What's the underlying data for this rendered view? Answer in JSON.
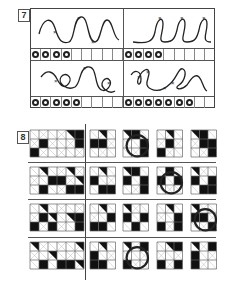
{
  "section7": {
    "number": "7",
    "tasks": [
      {
        "id": "top-left",
        "rings_filled": 4,
        "cells_total": 9
      },
      {
        "id": "top-right",
        "rings_filled": 4,
        "cells_total": 9
      },
      {
        "id": "bottom-left",
        "rings_filled": 5,
        "cells_total": 9
      },
      {
        "id": "bottom-right",
        "rings_filled": 7,
        "cells_total": 9
      }
    ]
  },
  "section8": {
    "number": "8",
    "rows": [
      {
        "pattern_cols": 6,
        "options": 4,
        "circled_option": 2
      },
      {
        "pattern_cols": 6,
        "options": 4,
        "circled_option": 3
      },
      {
        "pattern_cols": 6,
        "options": 4,
        "circled_option": 4
      },
      {
        "pattern_cols": 6,
        "options": 4,
        "circled_option": 2
      }
    ]
  },
  "colors": {
    "ink": "#222222",
    "line": "#888888",
    "paper": "#ffffff"
  }
}
